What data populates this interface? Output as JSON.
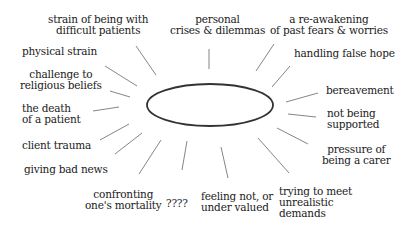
{
  "diagram": {
    "type": "spider-diagram",
    "center": {
      "shape": "ellipse",
      "label": "",
      "cx": 210,
      "cy": 105,
      "rx": 63,
      "ry": 21
    },
    "stroke_color": "#333333",
    "spoke_color": "#777777",
    "nodes": [
      {
        "id": "strain-difficult-patients",
        "lines": [
          "strain of being with",
          "difficult patients"
        ],
        "x": 48,
        "y": 14,
        "align": "c",
        "spoke": [
          136,
          46,
          156,
          75
        ]
      },
      {
        "id": "personal-crises",
        "lines": [
          "personal",
          "crises & dilemmas"
        ],
        "x": 170,
        "y": 14,
        "align": "c",
        "spoke": [
          209,
          49,
          209,
          69
        ]
      },
      {
        "id": "reawakening-fears",
        "lines": [
          "a re-awakening",
          "of past fears & worries"
        ],
        "x": 270,
        "y": 14,
        "align": "c",
        "spoke": [
          274,
          44,
          256,
          71
        ]
      },
      {
        "id": "physical-strain",
        "lines": [
          "physical strain"
        ],
        "x": 22,
        "y": 46,
        "align": "l",
        "spoke": [
          105,
          66,
          137,
          86
        ]
      },
      {
        "id": "handling-false-hope",
        "lines": [
          "handling false hope"
        ],
        "x": 294,
        "y": 48,
        "align": "l",
        "spoke": [
          290,
          66,
          272,
          87
        ]
      },
      {
        "id": "challenge-religious-beliefs",
        "lines": [
          "challenge to",
          "religious beliefs"
        ],
        "x": 20,
        "y": 69,
        "align": "c",
        "spoke": [
          110,
          91,
          130,
          97
        ]
      },
      {
        "id": "bereavement",
        "lines": [
          "bereavement"
        ],
        "x": 326,
        "y": 85,
        "align": "l",
        "spoke": [
          318,
          93,
          286,
          102
        ]
      },
      {
        "id": "death-of-patient",
        "lines": [
          "the death",
          "of a patient"
        ],
        "x": 22,
        "y": 103,
        "align": "l",
        "spoke": [
          93,
          111,
          119,
          107
        ]
      },
      {
        "id": "not-being-supported",
        "lines": [
          "not being",
          "supported"
        ],
        "x": 327,
        "y": 108,
        "align": "l",
        "spoke": [
          288,
          114,
          316,
          117
        ]
      },
      {
        "id": "client-trauma",
        "lines": [
          "client trauma"
        ],
        "x": 22,
        "y": 140,
        "align": "l",
        "spoke": [
          100,
          140,
          129,
          124
        ]
      },
      {
        "id": "pressure-of-carer",
        "lines": [
          "pressure of",
          "being a carer"
        ],
        "x": 322,
        "y": 144,
        "align": "c",
        "spoke": [
          277,
          128,
          308,
          144
        ]
      },
      {
        "id": "giving-bad-news",
        "lines": [
          "giving bad news"
        ],
        "x": 24,
        "y": 164,
        "align": "l",
        "spoke": [
          115,
          154,
          142,
          133
        ]
      },
      {
        "id": "confronting-mortality",
        "lines": [
          "confronting",
          "one's mortality"
        ],
        "x": 85,
        "y": 189,
        "align": "c",
        "spoke": [
          139,
          174,
          161,
          140
        ]
      },
      {
        "id": "unknown",
        "lines": [
          "????"
        ],
        "x": 166,
        "y": 198,
        "align": "l",
        "spoke": [
          182,
          170,
          187,
          141
        ]
      },
      {
        "id": "feeling-not-valued",
        "lines": [
          "feeling not, or",
          "under valued"
        ],
        "x": 201,
        "y": 191,
        "align": "l",
        "spoke": [
          221,
          147,
          228,
          178
        ]
      },
      {
        "id": "unrealistic-demands",
        "lines": [
          "trying to meet",
          "unrealistic",
          "demands"
        ],
        "x": 279,
        "y": 186,
        "align": "l",
        "spoke": [
          258,
          138,
          289,
          173
        ]
      }
    ]
  }
}
